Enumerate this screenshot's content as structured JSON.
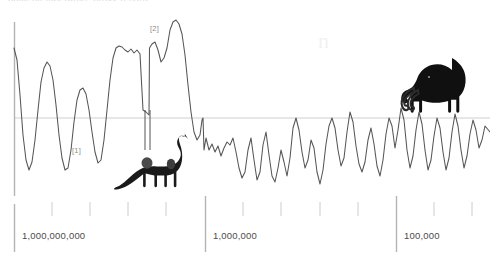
{
  "figure": {
    "title_clipped": "palaeotemperature proxy record",
    "background_color": "#ffffff",
    "curve_color": "#555555",
    "axis_color": "#b3b3b3",
    "baseline_color": "#cfcfcf",
    "label_color": "#4c4c4c",
    "silhouette_color": "#1a1a1a",
    "watermark": "n"
  },
  "axis": {
    "orientation": "horizontal-log-reversed",
    "unit_note": "years before present",
    "major_ticks": [
      {
        "label": "1,000,000,000",
        "x": 14
      },
      {
        "label": "1,000,000",
        "x": 205
      },
      {
        "label": "100,000",
        "x": 396
      }
    ],
    "minor_tick_count": 14,
    "baseline_y": 118,
    "vertical_axis_x": 14
  },
  "annotations": [
    {
      "id": "ref-1",
      "label": "[1]",
      "x": 72,
      "y": 150
    },
    {
      "id": "ref-2",
      "label": "[2]",
      "x": 150,
      "y": 28
    }
  ],
  "silhouettes": [
    {
      "name": "sauropod-dinosaur",
      "x": 118,
      "y": 135,
      "width": 78,
      "height": 62
    },
    {
      "name": "woolly-mammoth",
      "x": 418,
      "y": 66,
      "width": 58,
      "height": 55
    }
  ],
  "chart_data": {
    "type": "line",
    "title": "",
    "xlabel": "years before present",
    "ylabel": "",
    "grid": false,
    "legend": "none",
    "xaxis_scale": "log-reversed",
    "xticklabels": [
      "1,000,000,000",
      "1,000,000",
      "100,000"
    ],
    "baseline_value": 0,
    "annotations": [
      "[1]",
      "[2]"
    ],
    "series": [
      {
        "name": "temperature proxy",
        "points": [
          [
            14,
            48
          ],
          [
            17,
            60
          ],
          [
            20,
            95
          ],
          [
            23,
            135
          ],
          [
            26,
            160
          ],
          [
            29,
            170
          ],
          [
            32,
            162
          ],
          [
            35,
            140
          ],
          [
            38,
            110
          ],
          [
            41,
            82
          ],
          [
            44,
            68
          ],
          [
            47,
            62
          ],
          [
            50,
            66
          ],
          [
            53,
            80
          ],
          [
            56,
            105
          ],
          [
            59,
            135
          ],
          [
            62,
            158
          ],
          [
            65,
            170
          ],
          [
            68,
            168
          ],
          [
            71,
            150
          ],
          [
            74,
            122
          ],
          [
            77,
            100
          ],
          [
            80,
            90
          ],
          [
            83,
            88
          ],
          [
            86,
            94
          ],
          [
            89,
            110
          ],
          [
            92,
            132
          ],
          [
            95,
            152
          ],
          [
            98,
            163
          ],
          [
            101,
            160
          ],
          [
            104,
            140
          ],
          [
            107,
            110
          ],
          [
            110,
            80
          ],
          [
            113,
            58
          ],
          [
            116,
            48
          ],
          [
            119,
            46
          ],
          [
            122,
            47
          ],
          [
            125,
            50
          ],
          [
            128,
            52
          ],
          [
            131,
            49
          ],
          [
            134,
            53
          ],
          [
            137,
            50
          ],
          [
            140,
            54
          ],
          [
            143,
            110
          ],
          [
            146,
            112
          ],
          [
            149,
            115
          ],
          [
            149.5,
            48
          ],
          [
            152,
            44
          ],
          [
            155,
            42
          ],
          [
            158,
            50
          ],
          [
            161,
            62
          ],
          [
            164,
            58
          ],
          [
            167,
            48
          ],
          [
            170,
            30
          ],
          [
            173,
            22
          ],
          [
            176,
            20
          ],
          [
            179,
            24
          ],
          [
            182,
            34
          ],
          [
            185,
            55
          ],
          [
            188,
            85
          ],
          [
            191,
            112
          ],
          [
            194,
            132
          ],
          [
            197,
            140
          ],
          [
            200,
            135
          ],
          [
            202,
            120
          ],
          [
            203,
            118
          ],
          [
            204,
            150
          ],
          [
            206,
            138
          ],
          [
            209,
            150
          ],
          [
            212,
            144
          ],
          [
            215,
            152
          ],
          [
            218,
            146
          ],
          [
            221,
            156
          ],
          [
            224,
            148
          ],
          [
            227,
            142
          ],
          [
            230,
            145
          ],
          [
            233,
            138
          ],
          [
            236,
            152
          ],
          [
            239,
            168
          ],
          [
            242,
            178
          ],
          [
            245,
            172
          ],
          [
            248,
            150
          ],
          [
            251,
            138
          ],
          [
            254,
            160
          ],
          [
            257,
            180
          ],
          [
            260,
            172
          ],
          [
            263,
            145
          ],
          [
            266,
            132
          ],
          [
            269,
            155
          ],
          [
            272,
            176
          ],
          [
            275,
            182
          ],
          [
            278,
            168
          ],
          [
            281,
            150
          ],
          [
            284,
            162
          ],
          [
            287,
            176
          ],
          [
            290,
            158
          ],
          [
            293,
            128
          ],
          [
            296,
            118
          ],
          [
            299,
            130
          ],
          [
            302,
            152
          ],
          [
            305,
            168
          ],
          [
            308,
            160
          ],
          [
            311,
            140
          ],
          [
            314,
            148
          ],
          [
            317,
            172
          ],
          [
            320,
            184
          ],
          [
            323,
            170
          ],
          [
            326,
            144
          ],
          [
            329,
            126
          ],
          [
            332,
            118
          ],
          [
            335,
            128
          ],
          [
            338,
            150
          ],
          [
            341,
            166
          ],
          [
            344,
            158
          ],
          [
            347,
            132
          ],
          [
            350,
            112
          ],
          [
            353,
            122
          ],
          [
            356,
            146
          ],
          [
            359,
            164
          ],
          [
            362,
            172
          ],
          [
            365,
            162
          ],
          [
            368,
            140
          ],
          [
            371,
            128
          ],
          [
            374,
            144
          ],
          [
            377,
            166
          ],
          [
            380,
            176
          ],
          [
            383,
            160
          ],
          [
            386,
            134
          ],
          [
            389,
            118
          ],
          [
            392,
            126
          ],
          [
            395,
            148
          ],
          [
            398,
            130
          ],
          [
            401,
            108
          ],
          [
            404,
            120
          ],
          [
            407,
            150
          ],
          [
            410,
            168
          ],
          [
            413,
            156
          ],
          [
            416,
            130
          ],
          [
            419,
            112
          ],
          [
            422,
            124
          ],
          [
            425,
            150
          ],
          [
            428,
            170
          ],
          [
            431,
            160
          ],
          [
            434,
            136
          ],
          [
            437,
            118
          ],
          [
            440,
            128
          ],
          [
            443,
            152
          ],
          [
            446,
            170
          ],
          [
            449,
            158
          ],
          [
            452,
            132
          ],
          [
            455,
            114
          ],
          [
            458,
            126
          ],
          [
            461,
            150
          ],
          [
            464,
            168
          ],
          [
            467,
            156
          ],
          [
            470,
            134
          ],
          [
            473,
            120
          ],
          [
            476,
            130
          ],
          [
            479,
            148
          ],
          [
            482,
            140
          ],
          [
            485,
            126
          ],
          [
            490,
            132
          ]
        ]
      }
    ]
  }
}
